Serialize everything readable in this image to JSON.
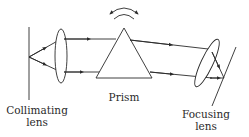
{
  "diagram": {
    "labels": {
      "collimating_line1": "Collimating",
      "collimating_line2": "lens",
      "prism": "Prism",
      "focusing_line1": "Focusing",
      "focusing_line2": "lens"
    },
    "components": [
      {
        "name": "source-slit",
        "type": "line"
      },
      {
        "name": "collimating-lens",
        "type": "ellipse"
      },
      {
        "name": "prism",
        "type": "triangle"
      },
      {
        "name": "rotation-arrow",
        "type": "double-headed curved arrow"
      },
      {
        "name": "focusing-lens",
        "type": "ellipse"
      },
      {
        "name": "detector-plane",
        "type": "line"
      }
    ],
    "colors": {
      "stroke": "#2a2a2a",
      "background": "#ffffff"
    }
  }
}
